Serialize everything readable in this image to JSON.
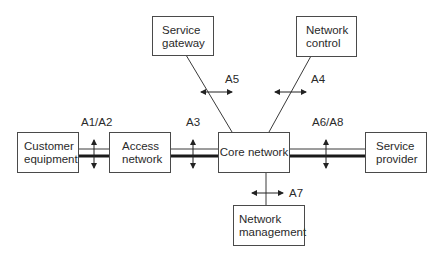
{
  "diagram": {
    "nodes": {
      "service_gateway": {
        "label": "Service\ngateway"
      },
      "network_control": {
        "label": "Network\ncontrol"
      },
      "customer_equipment": {
        "label": "Customer\nequipment"
      },
      "access_network": {
        "label": "Access\nnetwork"
      },
      "core_network": {
        "label": "Core network"
      },
      "service_provider": {
        "label": "Service\nprovider"
      },
      "network_management": {
        "label": "Network\nmanagement"
      }
    },
    "interfaces": {
      "a1_a2": "A1/A2",
      "a3": "A3",
      "a4": "A4",
      "a5": "A5",
      "a6_a8": "A6/A8",
      "a7": "A7"
    },
    "colors": {
      "line": "#3a3a3a",
      "thick_line": "#1a1a1a",
      "box_border": "#4a4a4a",
      "background": "#ffffff"
    }
  }
}
